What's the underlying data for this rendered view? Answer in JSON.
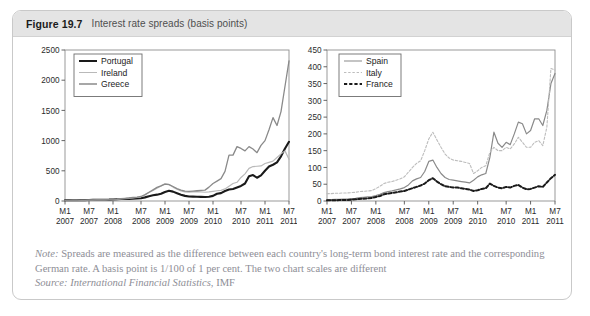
{
  "figure": {
    "number": "Figure 19.7",
    "title": "Interest rate spreads (basis points)"
  },
  "note": {
    "lead": "Note:",
    "line1_rest": " Spreads are measured as the difference between each country's long-term bond interest rate and the corresponding",
    "line2": "German rate. A basis point is 1/100 of 1 per cent. The two chart scales are different",
    "source_lead": "Source: International Financial Statistics",
    "source_rest": ", IMF"
  },
  "colors": {
    "header_band": "#e4e4e4",
    "border": "#c9c9c9",
    "note_text": "#8e8e96",
    "axis": "#555555",
    "portugal": "#1a1a1a",
    "ireland": "#b9b9b9",
    "greece": "#8a8a8a",
    "spain": "#8a8a8a",
    "italy": "#bdbdbd",
    "france": "#1a1a1a"
  },
  "chart_data": [
    {
      "id": "left",
      "type": "line",
      "title": "",
      "xlabel": "",
      "ylabel": "",
      "ylim": [
        0,
        2500
      ],
      "yticks": [
        0,
        500,
        1000,
        1500,
        2000,
        2500
      ],
      "grid": false,
      "legend_position": "top-left",
      "xticks": [
        "M1",
        "M7",
        "M1",
        "M7",
        "M1",
        "M7",
        "M1",
        "M7",
        "M1",
        "M7"
      ],
      "xtick_years": [
        "2007",
        "2007",
        "2008",
        "2008",
        "2009",
        "2009",
        "2010",
        "2010",
        "2011",
        "2011"
      ],
      "x": [
        "2007M1",
        "2007M2",
        "2007M3",
        "2007M4",
        "2007M5",
        "2007M6",
        "2007M7",
        "2007M8",
        "2007M9",
        "2007M10",
        "2007M11",
        "2007M12",
        "2008M1",
        "2008M2",
        "2008M3",
        "2008M4",
        "2008M5",
        "2008M6",
        "2008M7",
        "2008M8",
        "2008M9",
        "2008M10",
        "2008M11",
        "2008M12",
        "2009M1",
        "2009M2",
        "2009M3",
        "2009M4",
        "2009M5",
        "2009M6",
        "2009M7",
        "2009M8",
        "2009M9",
        "2009M10",
        "2009M11",
        "2009M12",
        "2010M1",
        "2010M2",
        "2010M3",
        "2010M4",
        "2010M5",
        "2010M6",
        "2010M7",
        "2010M8",
        "2010M9",
        "2010M10",
        "2010M11",
        "2010M12",
        "2011M1",
        "2011M2",
        "2011M3",
        "2011M4",
        "2011M5",
        "2011M6",
        "2011M7",
        "2011M8",
        "2011M9"
      ],
      "series": [
        {
          "name": "Portugal",
          "style": "solid",
          "width": 2.1,
          "color": "#1a1a1a",
          "values": [
            12,
            12,
            13,
            13,
            14,
            15,
            16,
            18,
            20,
            20,
            21,
            22,
            25,
            28,
            32,
            33,
            35,
            38,
            42,
            45,
            60,
            80,
            95,
            105,
            120,
            150,
            170,
            155,
            130,
            105,
            85,
            75,
            72,
            70,
            68,
            65,
            70,
            85,
            120,
            130,
            165,
            190,
            200,
            225,
            250,
            290,
            410,
            430,
            385,
            425,
            500,
            570,
            600,
            640,
            740,
            870,
            980
          ]
        },
        {
          "name": "Ireland",
          "style": "solid",
          "width": 1.2,
          "color": "#b9b9b9",
          "values": [
            8,
            8,
            9,
            10,
            11,
            12,
            13,
            15,
            17,
            18,
            19,
            21,
            24,
            28,
            35,
            40,
            45,
            52,
            60,
            70,
            100,
            140,
            175,
            210,
            250,
            285,
            275,
            230,
            195,
            165,
            150,
            145,
            150,
            155,
            150,
            145,
            150,
            160,
            170,
            175,
            200,
            245,
            290,
            310,
            390,
            450,
            540,
            570,
            575,
            580,
            620,
            640,
            660,
            720,
            780,
            830,
            690
          ]
        },
        {
          "name": "Greece",
          "style": "solid",
          "width": 1.3,
          "color": "#8a8a8a",
          "values": [
            10,
            10,
            11,
            12,
            13,
            14,
            15,
            17,
            19,
            20,
            21,
            23,
            26,
            30,
            38,
            45,
            50,
            58,
            65,
            75,
            105,
            145,
            185,
            225,
            250,
            280,
            270,
            240,
            205,
            180,
            165,
            160,
            165,
            170,
            175,
            180,
            230,
            290,
            330,
            370,
            490,
            760,
            760,
            900,
            870,
            830,
            900,
            860,
            800,
            920,
            1000,
            1180,
            1380,
            1250,
            1480,
            1900,
            2320
          ]
        }
      ]
    },
    {
      "id": "right",
      "type": "line",
      "title": "",
      "xlabel": "",
      "ylabel": "",
      "ylim": [
        0,
        450
      ],
      "yticks": [
        0,
        50,
        100,
        150,
        200,
        250,
        300,
        350,
        400,
        450
      ],
      "grid": false,
      "legend_position": "top-left",
      "xticks": [
        "M1",
        "M7",
        "M1",
        "M7",
        "M1",
        "M7",
        "M1",
        "M7",
        "M1",
        "M7"
      ],
      "xtick_years": [
        "2007",
        "2007",
        "2008",
        "2008",
        "2009",
        "2009",
        "2010",
        "2010",
        "2011",
        "2011"
      ],
      "x": [
        "2007M1",
        "2007M2",
        "2007M3",
        "2007M4",
        "2007M5",
        "2007M6",
        "2007M7",
        "2007M8",
        "2007M9",
        "2007M10",
        "2007M11",
        "2007M12",
        "2008M1",
        "2008M2",
        "2008M3",
        "2008M4",
        "2008M5",
        "2008M6",
        "2008M7",
        "2008M8",
        "2008M9",
        "2008M10",
        "2008M11",
        "2008M12",
        "2009M1",
        "2009M2",
        "2009M3",
        "2009M4",
        "2009M5",
        "2009M6",
        "2009M7",
        "2009M8",
        "2009M9",
        "2009M10",
        "2009M11",
        "2009M12",
        "2010M1",
        "2010M2",
        "2010M3",
        "2010M4",
        "2010M5",
        "2010M6",
        "2010M7",
        "2010M8",
        "2010M9",
        "2010M10",
        "2010M11",
        "2010M12",
        "2011M1",
        "2011M2",
        "2011M3",
        "2011M4",
        "2011M5",
        "2011M6",
        "2011M7",
        "2011M8",
        "2011M9"
      ],
      "series": [
        {
          "name": "Spain",
          "style": "solid",
          "width": 1.2,
          "color": "#8a8a8a",
          "values": [
            4,
            4,
            5,
            5,
            6,
            6,
            7,
            8,
            10,
            11,
            12,
            13,
            16,
            20,
            25,
            28,
            30,
            33,
            36,
            40,
            48,
            60,
            66,
            70,
            88,
            118,
            122,
            100,
            82,
            70,
            64,
            62,
            60,
            58,
            56,
            54,
            62,
            72,
            78,
            82,
            130,
            205,
            172,
            160,
            175,
            168,
            200,
            235,
            230,
            200,
            210,
            245,
            245,
            225,
            270,
            350,
            380
          ]
        },
        {
          "name": "Italy",
          "style": "dashed",
          "width": 1.1,
          "color": "#bdbdbd",
          "values": [
            22,
            22,
            23,
            23,
            24,
            24,
            25,
            26,
            28,
            29,
            30,
            31,
            37,
            44,
            52,
            56,
            58,
            62,
            66,
            72,
            86,
            100,
            112,
            120,
            150,
            185,
            205,
            182,
            160,
            140,
            128,
            122,
            120,
            118,
            115,
            112,
            82,
            90,
            100,
            105,
            145,
            160,
            150,
            150,
            160,
            155,
            170,
            190,
            175,
            160,
            160,
            175,
            180,
            165,
            220,
            395,
            390
          ]
        },
        {
          "name": "France",
          "style": "dashed",
          "width": 2.0,
          "color": "#1a1a1a",
          "values": [
            2,
            2,
            2,
            3,
            3,
            3,
            4,
            5,
            6,
            7,
            8,
            9,
            12,
            15,
            20,
            22,
            24,
            26,
            28,
            30,
            34,
            38,
            42,
            46,
            52,
            62,
            68,
            58,
            50,
            44,
            42,
            40,
            40,
            38,
            36,
            34,
            30,
            32,
            36,
            38,
            52,
            45,
            40,
            38,
            42,
            40,
            45,
            48,
            40,
            35,
            36,
            40,
            44,
            42,
            55,
            68,
            78
          ]
        }
      ]
    }
  ]
}
